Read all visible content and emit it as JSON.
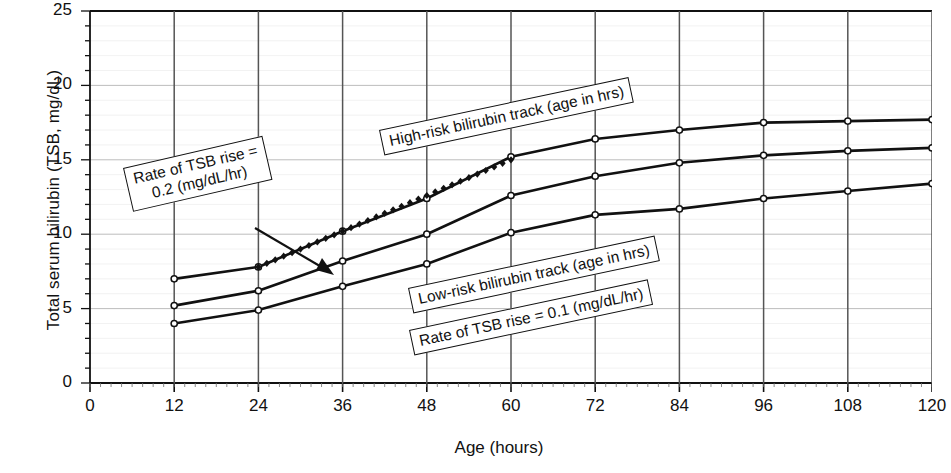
{
  "chart_data": {
    "type": "line",
    "title": "",
    "xlabel": "Age (hours)",
    "ylabel": "Total serum bilirubin (TSB, mg/dL)",
    "xlim": [
      0,
      120
    ],
    "ylim": [
      0,
      25
    ],
    "xticks": [
      0,
      12,
      24,
      36,
      48,
      60,
      72,
      84,
      96,
      108,
      120
    ],
    "yticks": [
      0,
      5,
      10,
      15,
      20,
      25
    ],
    "xtick_labels": [
      "0",
      "12",
      "24",
      "36",
      "48",
      "60",
      "72",
      "84",
      "96",
      "108",
      "120"
    ],
    "ytick_labels": [
      "0",
      "5",
      "10",
      "15",
      "20",
      "25"
    ],
    "grid": "major gridlines on both axes; minor ticks every 1 mg/dL on y and every 1.5 h on x",
    "legend_position": "none (inline callout boxes)",
    "x": [
      12,
      24,
      36,
      48,
      60,
      72,
      84,
      96,
      108,
      120
    ],
    "series": [
      {
        "name": "High-risk bilirubin track",
        "style": "solid-with-open-circle-markers",
        "values": [
          7.0,
          7.8,
          10.2,
          12.4,
          15.2,
          16.4,
          17.0,
          17.5,
          17.6,
          17.7
        ]
      },
      {
        "name": "Middle bilirubin track",
        "style": "solid-with-open-circle-markers",
        "values": [
          5.2,
          6.2,
          8.2,
          10.0,
          12.6,
          13.9,
          14.8,
          15.3,
          15.6,
          15.8
        ]
      },
      {
        "name": "Low-risk bilirubin track",
        "style": "solid-with-open-circle-markers",
        "values": [
          4.0,
          4.9,
          6.5,
          8.0,
          10.1,
          11.3,
          11.7,
          12.4,
          12.9,
          13.4
        ]
      },
      {
        "name": "Rate of TSB rise = 0.2 (mg/dL/hr)",
        "style": "dotted-diamond-markers",
        "x": [
          24,
          60
        ],
        "values": [
          7.8,
          15.0
        ]
      }
    ],
    "annotations": [
      {
        "id": "rate-02",
        "text_lines": [
          "Rate of TSB rise =",
          "0.2 (mg/dL/hr)"
        ],
        "has_leader_arrow": true
      },
      {
        "id": "high-risk",
        "text_lines": [
          "High-risk bilirubin track (age in hrs)"
        ],
        "has_leader_arrow": false
      },
      {
        "id": "low-risk",
        "text_lines": [
          "Low-risk bilirubin track (age in hrs)"
        ],
        "has_leader_arrow": false
      },
      {
        "id": "rate-01",
        "text_lines": [
          "Rate of TSB rise = 0.1 (mg/dL/hr)"
        ],
        "has_leader_arrow": false
      }
    ],
    "colors": {
      "line": "#111111",
      "grid": "#555555",
      "minor_grid": "#c9c9c9",
      "background": "#ffffff"
    }
  },
  "axes": {
    "x_title": "Age (hours)",
    "y_title": "Total serum bilirubin (TSB, mg/dL)"
  },
  "callouts": {
    "rate02_line1": "Rate of TSB rise =",
    "rate02_line2": "0.2 (mg/dL/hr)",
    "high_risk": "High-risk bilirubin track (age in hrs)",
    "low_risk": "Low-risk bilirubin track (age in hrs)",
    "rate01": "Rate of TSB rise = 0.1 (mg/dL/hr)"
  }
}
